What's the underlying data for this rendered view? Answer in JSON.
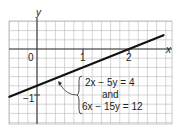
{
  "chart_data": {
    "type": "line",
    "title": "",
    "xlabel": "x",
    "ylabel": "y",
    "xlim": [
      -0.6,
      2.93
    ],
    "ylim": [
      -1.63,
      0.6
    ],
    "grid": true,
    "minor_divisions_per_unit": 5,
    "x_tick_labels": [
      {
        "value": 0,
        "text": "0"
      },
      {
        "value": 1,
        "text": "1"
      },
      {
        "value": 2,
        "text": "2"
      }
    ],
    "y_tick_labels": [
      {
        "value": -1,
        "text": "−1"
      }
    ],
    "series": [
      {
        "name": "2x - 5y = 4",
        "slope": 0.4,
        "intercept": -0.8,
        "x": [
          -0.6,
          2.75
        ],
        "y": [
          -1.04,
          0.3
        ]
      }
    ],
    "annotation": {
      "lines": [
        "2x − 5y = 4",
        "and",
        "6x − 15y = 12"
      ],
      "arrow_target": {
        "x": 0.45,
        "y": -0.62
      }
    }
  },
  "colors": {
    "grid": "#b8b8b8",
    "axis": "#333333",
    "line": "#111111"
  }
}
